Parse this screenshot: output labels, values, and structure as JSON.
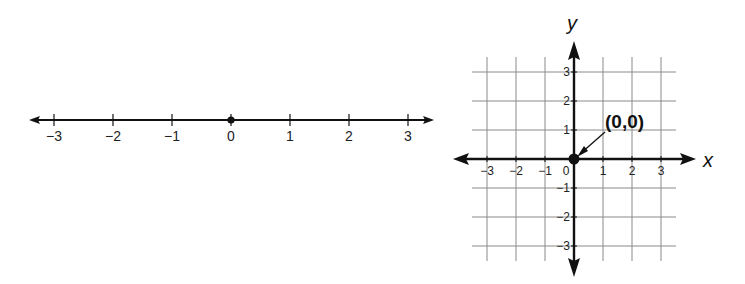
{
  "number_line": {
    "ticks": [
      -3,
      -2,
      -1,
      0,
      1,
      2,
      3
    ],
    "tick_labels": [
      "−3",
      "−2",
      "−1",
      "0",
      "1",
      "2",
      "3"
    ],
    "highlighted_point": 0,
    "arrows": "both-ends"
  },
  "coordinate_plane": {
    "x_axis_label": "x",
    "y_axis_label": "y",
    "x_range": [
      -3,
      3
    ],
    "y_range": [
      -3,
      3
    ],
    "x_tick_labels": [
      "−3",
      "−2",
      "−1",
      "0",
      "1",
      "2",
      "3"
    ],
    "y_tick_labels": [
      "3",
      "2",
      "1",
      "−1",
      "−2",
      "−3"
    ],
    "origin_label": "(0,0)",
    "highlighted_point": {
      "x": 0,
      "y": 0
    },
    "grid": true
  },
  "colors": {
    "ink": "#111111",
    "grid": "#8a8a8a",
    "background": "#ffffff"
  }
}
